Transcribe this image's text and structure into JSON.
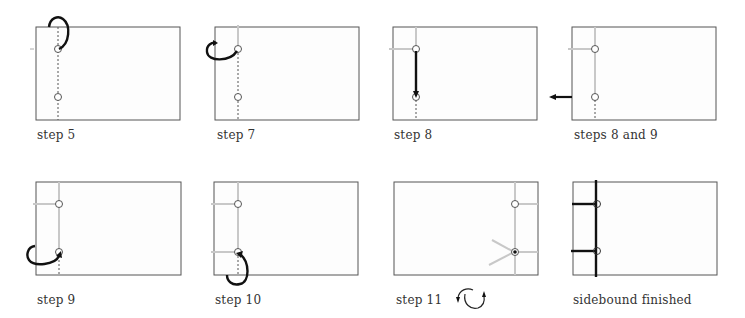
{
  "diagram": {
    "colors": {
      "page_border": "#555555",
      "page_fill": "#fdfdfd",
      "thread_active": "#111111",
      "thread_done": "#c8c8c8",
      "guide_dashed": "#555555"
    },
    "panels": [
      {
        "id": "step-5",
        "caption": "step 5"
      },
      {
        "id": "step-7",
        "caption": "step 7"
      },
      {
        "id": "step-8",
        "caption": "step 8"
      },
      {
        "id": "steps-8-9",
        "caption": "steps 8 and  9"
      },
      {
        "id": "step-9",
        "caption": "step 9"
      },
      {
        "id": "step-10",
        "caption": "step 10"
      },
      {
        "id": "step-11",
        "caption": "step 11",
        "icon": "rotate-icon"
      },
      {
        "id": "finished",
        "caption": "sidebound finished"
      }
    ]
  }
}
